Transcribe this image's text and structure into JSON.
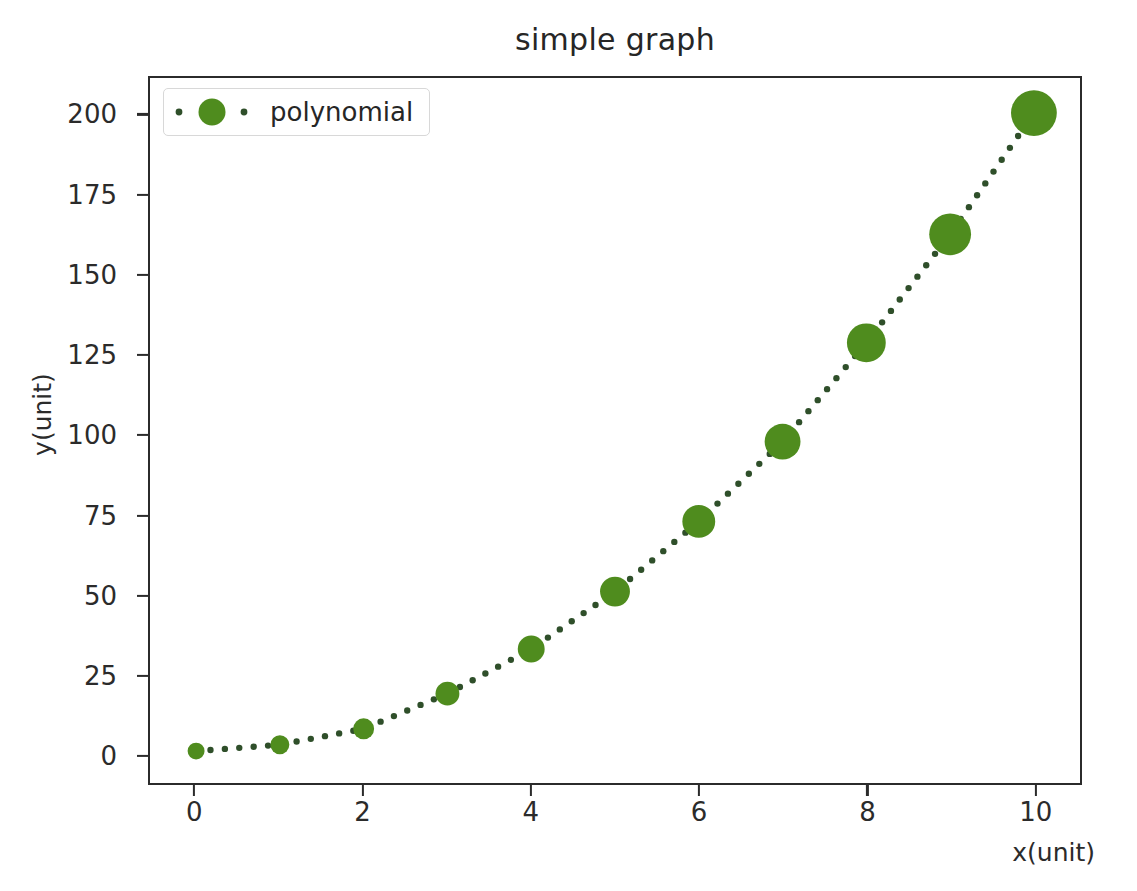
{
  "chart_data": {
    "type": "scatter",
    "title": "simple graph",
    "xlabel": "x(unit)",
    "ylabel": "y(unit)",
    "x": [
      0,
      1,
      2,
      3,
      4,
      5,
      6,
      7,
      8,
      9,
      10
    ],
    "values": [
      1,
      3,
      8,
      19,
      33,
      51,
      73,
      98,
      129,
      163,
      201
    ],
    "series": [
      {
        "name": "polynomial",
        "x": [
          0,
          1,
          2,
          3,
          4,
          5,
          6,
          7,
          8,
          9,
          10
        ],
        "values": [
          1,
          3,
          8,
          19,
          33,
          51,
          73,
          98,
          129,
          163,
          201
        ],
        "marker_sizes": [
          17,
          19,
          21,
          24,
          27,
          30,
          33,
          36,
          39,
          42,
          46
        ],
        "color": "#4f8c1e",
        "linestyle": "dotted",
        "line_color": "#2f4f2a",
        "marker": "o"
      }
    ],
    "xlim": [
      -0.55,
      10.55
    ],
    "ylim": [
      -9,
      212
    ],
    "xticks": [
      0,
      2,
      4,
      6,
      8,
      10
    ],
    "xtick_labels": [
      "0",
      "2",
      "4",
      "6",
      "8",
      "10"
    ],
    "yticks": [
      0,
      25,
      50,
      75,
      100,
      125,
      150,
      175,
      200
    ],
    "ytick_labels": [
      "0",
      "25",
      "50",
      "75",
      "100",
      "125",
      "150",
      "175",
      "200"
    ],
    "grid": false,
    "legend": {
      "entries": [
        "polynomial"
      ],
      "position": "upper left"
    }
  },
  "legend": {
    "label": "polynomial"
  }
}
